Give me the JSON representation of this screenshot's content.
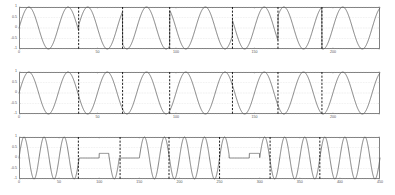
{
  "figure": {
    "background_color": "#ffffff",
    "frame_color": "#808080",
    "signal_color": "#595959",
    "marker_color": "#111111",
    "grid_color": "#c8c8c8",
    "width": 395,
    "height": 195
  },
  "chart_data": [
    {
      "type": "line",
      "title": "",
      "xlabel": "",
      "ylabel": "",
      "xlim": [
        0,
        230
      ],
      "ylim": [
        -1,
        1
      ],
      "xticks": [
        0,
        50,
        100,
        150,
        200
      ],
      "xtick_labels": [
        "0",
        "50",
        "100",
        "150",
        "200"
      ],
      "yticks": [
        -1,
        -0.5,
        0,
        0.5,
        1
      ],
      "ytick_labels": [
        "-1",
        "-0.5",
        "0",
        "0.5",
        "1"
      ],
      "grid": true,
      "legend": null,
      "series": [
        {
          "name": "phase-shift-keyed-signal",
          "waveform": "sine",
          "amplitude": 1,
          "samples_per_cycle": 25,
          "phase_flips_at": [
            38,
            66,
            96,
            136,
            165,
            193
          ]
        }
      ],
      "markers": {
        "name": "symbol-boundary-markers",
        "style": "dashed-vertical",
        "x": [
          38,
          66,
          96,
          136,
          165,
          193
        ]
      }
    },
    {
      "type": "line",
      "title": "",
      "xlabel": "",
      "ylabel": "",
      "xlim": [
        0,
        230
      ],
      "ylim": [
        -1,
        1
      ],
      "xticks": [
        0,
        50,
        100,
        150,
        200
      ],
      "xtick_labels": [
        "0",
        "50",
        "100",
        "150",
        "200"
      ],
      "yticks": [
        -1,
        -0.5,
        0,
        0.5,
        1
      ],
      "ytick_labels": [
        "-1",
        "-0.5",
        "0",
        "0.5",
        "1"
      ],
      "grid": true,
      "legend": null,
      "series": [
        {
          "name": "carrier-reference-signal",
          "waveform": "sine",
          "amplitude": 1,
          "samples_per_cycle": 25,
          "phase_flips_at": []
        }
      ],
      "markers": {
        "name": "symbol-boundary-markers",
        "style": "dashed-vertical",
        "x": [
          38,
          66,
          96,
          136,
          165,
          193
        ]
      }
    },
    {
      "type": "line",
      "title": "",
      "xlabel": "",
      "ylabel": "",
      "xlim": [
        0,
        450
      ],
      "ylim": [
        -1,
        1
      ],
      "xticks": [
        0,
        50,
        100,
        150,
        200,
        250,
        300,
        350,
        400,
        450
      ],
      "xtick_labels": [
        "0",
        "50",
        "100",
        "150",
        "200",
        "250",
        "300",
        "350",
        "400",
        "450"
      ],
      "yticks": [
        -1,
        -0.5,
        0,
        0.5,
        1
      ],
      "ytick_labels": [
        "-1",
        "-0.5",
        "0",
        "0.5",
        "1"
      ],
      "grid": true,
      "legend": null,
      "series": [
        {
          "name": "on-off-keyed-output-signal",
          "waveform": "sine-with-zero-hold",
          "amplitude": 1,
          "samples_per_cycle": 25,
          "zero_hold_intervals": [
            [
              75,
              100
            ],
            [
              125,
              150
            ],
            [
              262,
              287
            ]
          ],
          "partial_hold_intervals": [
            [
              100,
              112
            ],
            [
              287,
              300
            ]
          ]
        }
      ],
      "markers": {
        "name": "symbol-boundary-markers",
        "style": "dashed-vertical",
        "x": [
          74,
          126,
          187,
          250,
          313,
          375
        ]
      }
    }
  ]
}
